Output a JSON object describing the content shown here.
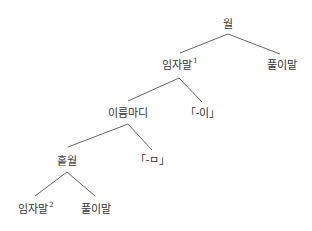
{
  "diagram": {
    "type": "syntax-tree",
    "stroke_color": "#555555",
    "text_color": "#333333",
    "nodes": {
      "root": {
        "label": "월",
        "sup": "",
        "x": 228,
        "y": 24
      },
      "subject1": {
        "label": "임자말",
        "sup": "1",
        "x": 180,
        "y": 65
      },
      "predicate_top": {
        "label": "풀이말",
        "sup": "",
        "x": 282,
        "y": 65
      },
      "noun_clause": {
        "label": "이름마디",
        "sup": "",
        "x": 128,
        "y": 113
      },
      "suffix_i": {
        "label": "「-이」",
        "sup": "",
        "x": 203,
        "y": 113
      },
      "simple_sentence": {
        "label": "홑월",
        "sup": "",
        "x": 67,
        "y": 161
      },
      "suffix_m": {
        "label": "「-ㅁ」",
        "sup": "",
        "x": 153,
        "y": 160
      },
      "subject2": {
        "label": "임자말",
        "sup": "2",
        "x": 36,
        "y": 209
      },
      "predicate_bottom": {
        "label": "풀이말",
        "sup": "",
        "x": 96,
        "y": 209
      }
    },
    "edges": [
      {
        "from": "root",
        "to": "subject1",
        "x1": 228,
        "y1": 34,
        "x2": 180,
        "y2": 53
      },
      {
        "from": "root",
        "to": "predicate_top",
        "x1": 228,
        "y1": 34,
        "x2": 280,
        "y2": 54
      },
      {
        "from": "subject1",
        "to": "noun_clause",
        "x1": 179,
        "y1": 78,
        "x2": 128,
        "y2": 101
      },
      {
        "from": "subject1",
        "to": "suffix_i",
        "x1": 179,
        "y1": 78,
        "x2": 202,
        "y2": 102
      },
      {
        "from": "noun_clause",
        "to": "simple_sentence",
        "x1": 128,
        "y1": 124,
        "x2": 68,
        "y2": 147
      },
      {
        "from": "noun_clause",
        "to": "suffix_m",
        "x1": 128,
        "y1": 124,
        "x2": 152,
        "y2": 150
      },
      {
        "from": "simple_sentence",
        "to": "subject2",
        "x1": 67,
        "y1": 172,
        "x2": 35,
        "y2": 196
      },
      {
        "from": "simple_sentence",
        "to": "predicate_bottom",
        "x1": 67,
        "y1": 172,
        "x2": 95,
        "y2": 196
      }
    ]
  }
}
